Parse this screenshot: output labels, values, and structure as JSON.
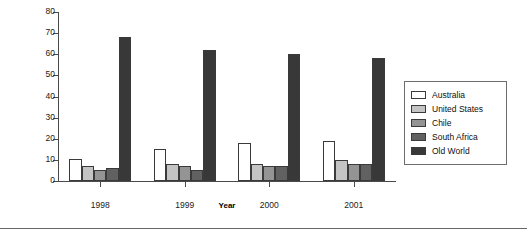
{
  "chart_data": {
    "type": "bar",
    "title": "",
    "xlabel": "Year",
    "ylabel": "Percentage",
    "categories": [
      "1998",
      "1999",
      "2000",
      "2001"
    ],
    "ylim": [
      0,
      80
    ],
    "yticks": [
      0,
      10,
      20,
      30,
      40,
      50,
      60,
      70,
      80
    ],
    "grid": false,
    "legend_position": "right",
    "series": [
      {
        "name": "Australia",
        "color": "#ffffff",
        "values": [
          10.5,
          15.0,
          18.0,
          19.0
        ]
      },
      {
        "name": "United States",
        "color": "#c4c4c4",
        "values": [
          7.0,
          8.0,
          8.0,
          10.0
        ]
      },
      {
        "name": "Chile",
        "color": "#949494",
        "values": [
          5.0,
          7.0,
          7.0,
          8.0
        ]
      },
      {
        "name": "South Africa",
        "color": "#616161",
        "values": [
          6.0,
          5.0,
          7.0,
          8.0
        ]
      },
      {
        "name": "Old World",
        "color": "#383838",
        "values": [
          68.0,
          62.0,
          60.0,
          58.0
        ]
      }
    ]
  },
  "legend": {
    "items": [
      {
        "label": "Australia"
      },
      {
        "label": "United States"
      },
      {
        "label": "Chile"
      },
      {
        "label": "South Africa"
      },
      {
        "label": "Old World"
      }
    ]
  },
  "axes": {
    "y_title": "Percentage",
    "x_title": "Year",
    "y_tick_labels": [
      "0",
      "10",
      "20",
      "30",
      "40",
      "50",
      "60",
      "70",
      "80"
    ],
    "x_tick_labels": [
      "1998",
      "1999",
      "2000",
      "2001"
    ]
  }
}
